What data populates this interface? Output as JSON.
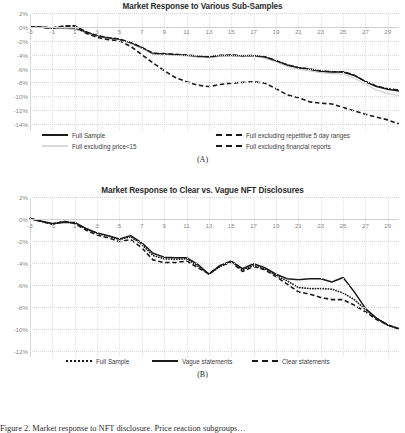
{
  "figure": {
    "caption": "Figure 2. Market response to NFT disclosure. Price reaction subgroups…"
  },
  "chart_data": [
    {
      "type": "line",
      "panel": "(A)",
      "title": "Market Response to Various Sub-Samples",
      "xlabel": "",
      "ylabel": "",
      "grid": true,
      "legend_position": "bottom",
      "ylim": [
        -15,
        2
      ],
      "ytick_labels": [
        "2%",
        "0%",
        "-2%",
        "-4%",
        "-6%",
        "-8%",
        "-10%",
        "-12%",
        "-14%"
      ],
      "ytick_values": [
        2,
        0,
        -2,
        -4,
        -6,
        -8,
        -10,
        -12,
        -14
      ],
      "xlim": [
        -3,
        30
      ],
      "xtick_labels": [
        "-3",
        "-1",
        "1",
        "3",
        "5",
        "7",
        "9",
        "11",
        "13",
        "15",
        "17",
        "19",
        "21",
        "23",
        "25",
        "27",
        "29"
      ],
      "xtick_values": [
        -3,
        -1,
        1,
        3,
        5,
        7,
        9,
        11,
        13,
        15,
        17,
        19,
        21,
        23,
        25,
        27,
        29
      ],
      "x": [
        -3,
        -2,
        -1,
        0,
        1,
        2,
        3,
        4,
        5,
        6,
        7,
        8,
        9,
        10,
        11,
        12,
        13,
        14,
        15,
        16,
        17,
        18,
        19,
        20,
        21,
        22,
        23,
        24,
        25,
        26,
        27,
        28,
        29,
        30
      ],
      "series": [
        {
          "name": "Full Sample",
          "style": "solid-thick",
          "color": "#1a1a1a",
          "values": [
            0.0,
            -0.05,
            -0.15,
            -0.2,
            -0.25,
            -0.75,
            -1.3,
            -1.6,
            -1.8,
            -2.3,
            -3.0,
            -3.85,
            -3.9,
            -4.0,
            -4.1,
            -4.25,
            -4.35,
            -4.15,
            -4.1,
            -4.2,
            -4.15,
            -4.35,
            -4.9,
            -5.5,
            -5.9,
            -6.1,
            -6.4,
            -6.5,
            -6.5,
            -7.0,
            -7.9,
            -8.6,
            -9.0,
            -9.25
          ]
        },
        {
          "name": "Full excluding price<15",
          "style": "thin-gray",
          "color": "#b6b6b6",
          "values": [
            0.0,
            -0.05,
            -0.18,
            -0.22,
            -0.3,
            -0.85,
            -1.4,
            -1.7,
            -1.9,
            -2.4,
            -3.1,
            -3.95,
            -4.0,
            -4.1,
            -4.2,
            -4.35,
            -4.45,
            -4.25,
            -4.2,
            -4.3,
            -4.25,
            -4.5,
            -5.05,
            -5.7,
            -6.1,
            -6.35,
            -6.6,
            -6.75,
            -6.8,
            -7.4,
            -8.3,
            -9.1,
            -9.6,
            -9.9
          ]
        },
        {
          "name": "Full excluding repetitive 5 day ranges",
          "style": "dashdot",
          "color": "#1a1a1a",
          "values": [
            0.0,
            -0.05,
            -0.15,
            0.1,
            0.15,
            -0.7,
            -1.25,
            -1.55,
            -1.75,
            -2.25,
            -2.95,
            -3.8,
            -3.85,
            -3.95,
            -4.05,
            -4.2,
            -4.3,
            -4.1,
            -4.05,
            -4.15,
            -4.1,
            -4.3,
            -4.85,
            -5.45,
            -5.85,
            -6.05,
            -6.35,
            -6.45,
            -6.45,
            -6.95,
            -7.85,
            -8.55,
            -8.9,
            -9.1
          ]
        },
        {
          "name": "Full excluding financial reports",
          "style": "dashed",
          "color": "#1a1a1a",
          "values": [
            0.0,
            -0.05,
            -0.15,
            0.1,
            0.15,
            -0.9,
            -1.5,
            -1.85,
            -2.0,
            -2.8,
            -4.0,
            -5.2,
            -6.3,
            -7.3,
            -7.9,
            -8.4,
            -8.6,
            -8.3,
            -8.1,
            -8.0,
            -7.9,
            -8.1,
            -8.9,
            -9.8,
            -10.2,
            -10.8,
            -11.0,
            -11.1,
            -11.6,
            -12.1,
            -12.6,
            -13.0,
            -13.4,
            -14.0
          ]
        }
      ]
    },
    {
      "type": "line",
      "panel": "(B)",
      "title": "Market Response to Clear vs. Vague NFT Disclosures",
      "xlabel": "",
      "ylabel": "",
      "grid": true,
      "legend_position": "bottom",
      "ylim": [
        -12.5,
        2
      ],
      "ytick_labels": [
        "2%",
        "0%",
        "-2%",
        "-4%",
        "-6%",
        "-8%",
        "-10%",
        "-12%"
      ],
      "ytick_values": [
        2,
        0,
        -2,
        -4,
        -6,
        -8,
        -10,
        -12
      ],
      "xlim": [
        -3,
        30
      ],
      "xtick_labels": [
        "-3",
        "-1",
        "1",
        "3",
        "5",
        "7",
        "9",
        "11",
        "13",
        "15",
        "17",
        "19",
        "21",
        "23",
        "25",
        "27",
        "29"
      ],
      "xtick_values": [
        -3,
        -1,
        1,
        3,
        5,
        7,
        9,
        11,
        13,
        15,
        17,
        19,
        21,
        23,
        25,
        27,
        29
      ],
      "x": [
        -3,
        -2,
        -1,
        0,
        1,
        2,
        3,
        4,
        5,
        6,
        7,
        8,
        9,
        10,
        11,
        12,
        13,
        14,
        15,
        16,
        17,
        18,
        19,
        20,
        21,
        22,
        23,
        24,
        25,
        26,
        27,
        28,
        29,
        30
      ],
      "series": [
        {
          "name": "Full Sample",
          "style": "dotted",
          "color": "#1a1a1a",
          "values": [
            0.05,
            -0.2,
            -0.45,
            -0.25,
            -0.35,
            -0.9,
            -1.3,
            -1.55,
            -1.85,
            -1.6,
            -2.3,
            -3.3,
            -3.6,
            -3.65,
            -3.6,
            -4.25,
            -5.0,
            -4.3,
            -3.85,
            -4.6,
            -4.2,
            -4.5,
            -5.1,
            -5.6,
            -6.2,
            -6.3,
            -6.3,
            -6.35,
            -6.7,
            -7.3,
            -8.2,
            -9.0,
            -9.6,
            -9.95
          ]
        },
        {
          "name": "Vague statements",
          "style": "solid-thick",
          "color": "#1a1a1a",
          "values": [
            0.05,
            -0.2,
            -0.4,
            -0.3,
            -0.3,
            -0.85,
            -1.25,
            -1.5,
            -1.8,
            -1.5,
            -2.15,
            -3.1,
            -3.45,
            -3.5,
            -3.5,
            -4.1,
            -5.0,
            -4.2,
            -3.8,
            -4.5,
            -4.05,
            -4.4,
            -5.0,
            -5.4,
            -5.5,
            -5.4,
            -5.4,
            -5.7,
            -5.3,
            -6.6,
            -8.1,
            -9.0,
            -9.6,
            -9.95
          ]
        },
        {
          "name": "Clear statements",
          "style": "dashed",
          "color": "#1a1a1a",
          "values": [
            0.05,
            -0.2,
            -0.5,
            -0.2,
            -0.4,
            -1.0,
            -1.45,
            -1.7,
            -2.05,
            -1.85,
            -2.6,
            -3.7,
            -3.95,
            -3.95,
            -3.8,
            -4.4,
            -4.95,
            -4.25,
            -3.9,
            -4.75,
            -4.3,
            -4.6,
            -5.2,
            -5.9,
            -6.6,
            -6.8,
            -7.1,
            -7.3,
            -7.3,
            -7.8,
            -8.4,
            -9.1,
            -9.6,
            -9.95
          ]
        }
      ]
    }
  ]
}
